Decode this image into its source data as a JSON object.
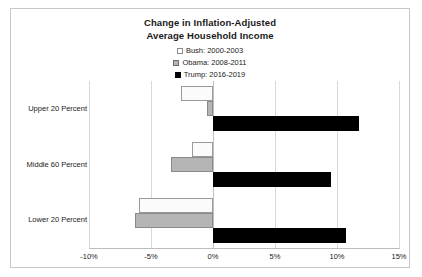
{
  "chart_data": {
    "type": "bar",
    "orientation": "horizontal",
    "title": "Change in Inflation-Adjusted Average Household Income",
    "title_line1": "Change in Inflation-Adjusted",
    "title_line2": "Average Household Income",
    "xlabel": "",
    "ylabel": "",
    "categories": [
      "Upper 20 Percent",
      "Middle 60 Percent",
      "Lower 20 Percent"
    ],
    "series": [
      {
        "name": "Bush: 2000-2003",
        "legend_label": "Bush: 2000-2003",
        "marker": "white-square",
        "color": "#ffffff",
        "border_color": "#8c8c8c",
        "values": [
          -2.6,
          -1.7,
          -6.0
        ]
      },
      {
        "name": "Obama: 2008-2011",
        "legend_label": "Obama: 2008-2011",
        "marker": "gray-square",
        "color": "#b3b3b3",
        "border_color": "#6e6e6e",
        "values": [
          -0.5,
          -3.4,
          -6.3
        ]
      },
      {
        "name": "Trump: 2016-2019",
        "legend_label": "Trump: 2016-2019",
        "marker": "black-square",
        "color": "#000000",
        "border_color": "#000000",
        "values": [
          11.8,
          9.5,
          10.7
        ]
      }
    ],
    "xlim": [
      -10,
      15
    ],
    "xticks": [
      -10,
      -5,
      0,
      5,
      10,
      15
    ],
    "xtick_labels": [
      "-10%",
      "-5%",
      "0%",
      "5%",
      "10%",
      "15%"
    ],
    "grid": true,
    "gridlines": "vertical",
    "legend_position": "top-center",
    "value_suffix": "%"
  }
}
